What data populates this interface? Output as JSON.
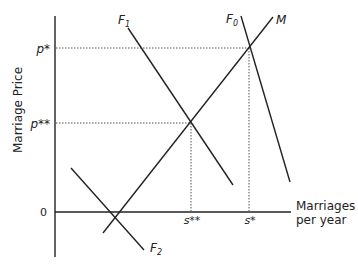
{
  "diagram": {
    "title": "",
    "y_axis": {
      "label": "Marriage Price"
    },
    "x_axis": {
      "label_line1": "Marriages",
      "label_line2": "per year"
    },
    "y_ticks": [
      {
        "label": "p*",
        "key": "p_star"
      },
      {
        "label": "p**",
        "key": "p_double_star"
      },
      {
        "label": "0",
        "key": "origin"
      }
    ],
    "x_ticks": [
      {
        "label": "s**",
        "key": "s_double_star"
      },
      {
        "label": "s*",
        "key": "s_star"
      }
    ],
    "curves": [
      {
        "name": "M",
        "sub": "",
        "type": "upward-sloping"
      },
      {
        "name": "F",
        "sub": "0",
        "type": "downward-sloping"
      },
      {
        "name": "F",
        "sub": "1",
        "type": "downward-sloping"
      },
      {
        "name": "F",
        "sub": "2",
        "type": "downward-sloping"
      }
    ],
    "colors": {
      "line": "#222222",
      "guide": "#555555",
      "background": "#ffffff"
    }
  }
}
